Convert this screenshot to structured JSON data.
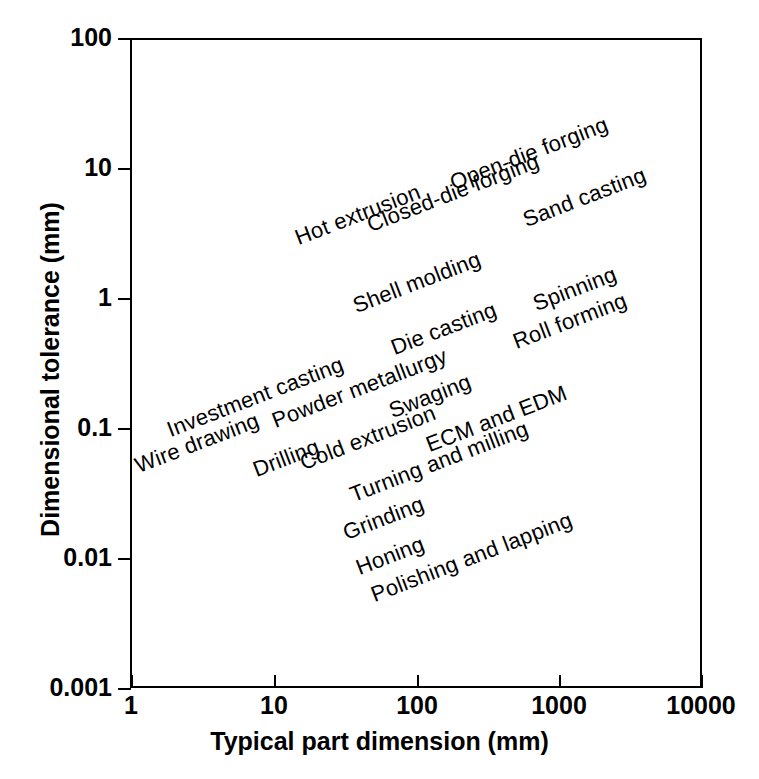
{
  "chart_data": {
    "type": "scatter",
    "title": "",
    "xlabel": "Typical part dimension (mm)",
    "ylabel": "Dimensional tolerance (mm)",
    "xscale": "log",
    "yscale": "log",
    "xlim": [
      1,
      10000
    ],
    "ylim": [
      0.001,
      100
    ],
    "grid": false,
    "legend": "none",
    "xticks": [
      "1",
      "10",
      "100",
      "1000",
      "10000"
    ],
    "yticks": [
      "100",
      "10",
      "1",
      "0.1",
      "0.01",
      "0.001"
    ],
    "annotation_rotation_deg": -21,
    "annotations": [
      {
        "label": "Hot extrusion",
        "x_mm": 42,
        "y_mm": 2.8
      },
      {
        "label": "Open-die forging",
        "x_mm": 260,
        "y_mm": 9.0
      },
      {
        "label": "Closed-die forging",
        "x_mm": 95,
        "y_mm": 3.6
      },
      {
        "label": "Sand casting",
        "x_mm": 620,
        "y_mm": 4.0
      },
      {
        "label": "Shell molding",
        "x_mm": 75,
        "y_mm": 0.72
      },
      {
        "label": "Spinning",
        "x_mm": 680,
        "y_mm": 0.75
      },
      {
        "label": "Die casting",
        "x_mm": 130,
        "y_mm": 0.37
      },
      {
        "label": "Roll forming",
        "x_mm": 550,
        "y_mm": 0.4
      },
      {
        "label": "Investment casting",
        "x_mm": 2.0,
        "y_mm": 0.13
      },
      {
        "label": "Powder metallurgy",
        "x_mm": 11,
        "y_mm": 0.15
      },
      {
        "label": "Swaging",
        "x_mm": 70,
        "y_mm": 0.17
      },
      {
        "label": "Wire drawing",
        "x_mm": 1.2,
        "y_mm": 0.065
      },
      {
        "label": "Drilling",
        "x_mm": 8.0,
        "y_mm": 0.062
      },
      {
        "label": "Cold extrusion",
        "x_mm": 17,
        "y_mm": 0.068
      },
      {
        "label": "ECM and EDM",
        "x_mm": 130,
        "y_mm": 0.085
      },
      {
        "label": "Turning and milling",
        "x_mm": 45,
        "y_mm": 0.042
      },
      {
        "label": "Grinding",
        "x_mm": 40,
        "y_mm": 0.022
      },
      {
        "label": "Honing",
        "x_mm": 47,
        "y_mm": 0.012
      },
      {
        "label": "Polishing and lapping",
        "x_mm": 58,
        "y_mm": 0.0068
      }
    ]
  },
  "axes": {
    "x_title": "Typical part dimension (mm)",
    "y_title": "Dimensional tolerance (mm)",
    "x_ticks": [
      {
        "label": "1",
        "px": 131
      },
      {
        "label": "10",
        "px": 274
      },
      {
        "label": "100",
        "px": 417
      },
      {
        "label": "1000",
        "px": 559
      },
      {
        "label": "10000",
        "px": 701
      }
    ],
    "y_ticks": [
      {
        "label": "100",
        "px": 38
      },
      {
        "label": "10",
        "px": 168
      },
      {
        "label": "1",
        "px": 298
      },
      {
        "label": "0.1",
        "px": 428
      },
      {
        "label": "0.01",
        "px": 558
      },
      {
        "label": "0.001",
        "px": 688
      }
    ]
  },
  "labels": [
    {
      "text": "Hot extrusion",
      "x": 300,
      "y": 249
    },
    {
      "text": "Open-die forging",
      "x": 455,
      "y": 194
    },
    {
      "text": "Closed-die forging",
      "x": 372,
      "y": 236
    },
    {
      "text": "Sand casting",
      "x": 528,
      "y": 231
    },
    {
      "text": "Shell molding",
      "x": 358,
      "y": 317
    },
    {
      "text": "Spinning",
      "x": 538,
      "y": 315
    },
    {
      "text": "Die casting",
      "x": 396,
      "y": 359
    },
    {
      "text": "Roll forming",
      "x": 518,
      "y": 353
    },
    {
      "text": "Investment casting",
      "x": 172,
      "y": 441
    },
    {
      "text": "Powder metallurgy",
      "x": 277,
      "y": 432
    },
    {
      "text": "Swaging",
      "x": 394,
      "y": 422
    },
    {
      "text": "Wire drawing",
      "x": 140,
      "y": 477
    },
    {
      "text": "Drilling",
      "x": 258,
      "y": 481
    },
    {
      "text": "Cold extrusion",
      "x": 305,
      "y": 474
    },
    {
      "text": "ECM and EDM",
      "x": 431,
      "y": 456
    },
    {
      "text": "Turning and milling",
      "x": 355,
      "y": 506
    },
    {
      "text": "Grinding",
      "x": 348,
      "y": 544
    },
    {
      "text": "Honing",
      "x": 361,
      "y": 579
    },
    {
      "text": "Polishing and lapping",
      "x": 376,
      "y": 606
    }
  ],
  "style": {
    "ink": "#000000",
    "paper": "#ffffff"
  }
}
